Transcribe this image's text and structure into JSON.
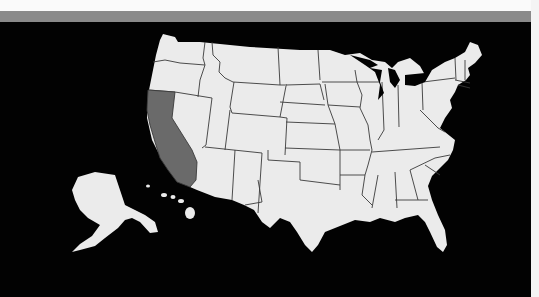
{
  "map": {
    "title": "United States",
    "highlighted_state": "California",
    "colors": {
      "background": "#020202",
      "land": "#ebebeb",
      "highlight": "#6a6a6a",
      "border": "#3a3a3a",
      "header_bar": "#8a8a8a"
    },
    "regions": [
      "Contiguous United States",
      "Alaska",
      "Hawaii"
    ]
  }
}
